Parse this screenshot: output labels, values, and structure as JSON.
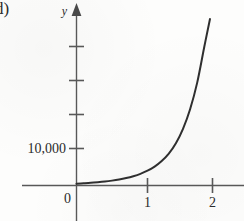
{
  "figure": {
    "item_label": "d)"
  },
  "chart_data": {
    "type": "line",
    "title": "",
    "subtitle": "",
    "xlabel": "",
    "ylabel": "y",
    "y_axis_name": "y",
    "grid": false,
    "legend": null,
    "annotations": [],
    "xlim": [
      -0.15,
      2.3
    ],
    "ylim": [
      0,
      45000
    ],
    "x_ticks": [
      {
        "value": 1,
        "label": "1"
      },
      {
        "value": 2,
        "label": "2"
      }
    ],
    "y_ticks": [
      {
        "value": 10000,
        "label": "10,000"
      },
      {
        "value": 20000,
        "label": ""
      },
      {
        "value": 30000,
        "label": ""
      },
      {
        "value": 40000,
        "label": ""
      }
    ],
    "origin_label": "0",
    "series": [
      {
        "name": "exponential curve",
        "x": [
          0.0,
          0.1,
          0.2,
          0.3,
          0.4,
          0.5,
          0.6,
          0.7,
          0.8,
          0.9,
          1.0,
          1.1,
          1.2,
          1.3,
          1.4,
          1.5,
          1.6,
          1.7,
          1.8,
          1.88
        ],
        "y": [
          500,
          600,
          720,
          880,
          1070,
          1320,
          1630,
          2020,
          2520,
          3160,
          4000,
          5100,
          6600,
          8600,
          11400,
          15300,
          20600,
          27800,
          37500,
          45000
        ]
      }
    ]
  },
  "colors": {
    "axis": "#585858",
    "curve": "#2f2f2f",
    "text": "#2b2b2b",
    "paper": "#fdfdfc"
  }
}
